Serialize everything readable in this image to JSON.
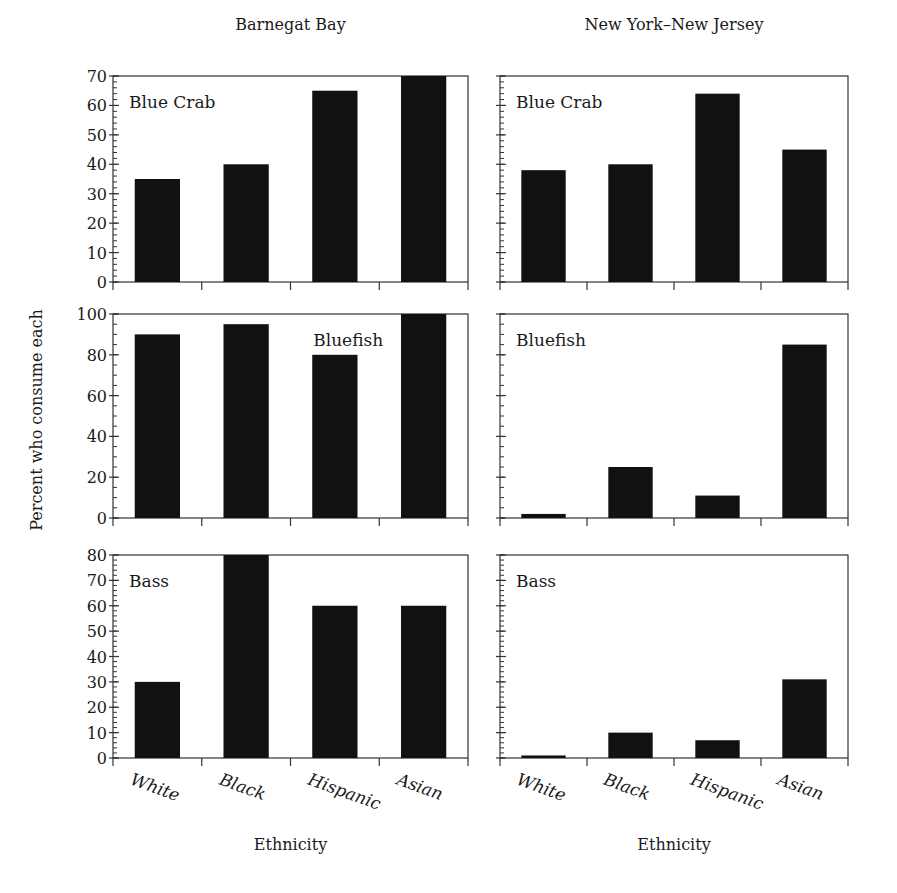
{
  "chart_data": {
    "type": "bar",
    "title": "",
    "ylabel": "Percent who consume each",
    "xlabel": "Ethnicity",
    "categories": [
      "White",
      "Black",
      "Hispanic",
      "Asian"
    ],
    "columns": [
      "Barnegat Bay",
      "New York–New Jersey"
    ],
    "grid": false,
    "bar_color": "#111111",
    "panels": [
      {
        "row": 0,
        "col": 0,
        "location": "Barnegat Bay",
        "species": "Blue Crab",
        "ylim": [
          0,
          70
        ],
        "major_ticks": [
          0,
          10,
          20,
          30,
          40,
          50,
          60,
          70
        ],
        "minor_step": 2,
        "values": [
          35,
          40,
          65,
          70
        ],
        "label_pos": "left"
      },
      {
        "row": 0,
        "col": 1,
        "location": "New York–New Jersey",
        "species": "Blue Crab",
        "ylim": [
          0,
          70
        ],
        "major_ticks": [
          0,
          10,
          20,
          30,
          40,
          50,
          60,
          70
        ],
        "minor_step": 2,
        "values": [
          38,
          40,
          64,
          45
        ],
        "label_pos": "left"
      },
      {
        "row": 1,
        "col": 0,
        "location": "Barnegat Bay",
        "species": "Bluefish",
        "ylim": [
          0,
          100
        ],
        "major_ticks": [
          0,
          20,
          40,
          60,
          80,
          100
        ],
        "minor_step": 5,
        "values": [
          90,
          95,
          80,
          100
        ],
        "label_pos": "center"
      },
      {
        "row": 1,
        "col": 1,
        "location": "New York–New Jersey",
        "species": "Bluefish",
        "ylim": [
          0,
          100
        ],
        "major_ticks": [
          0,
          20,
          40,
          60,
          80,
          100
        ],
        "minor_step": 5,
        "values": [
          2,
          25,
          11,
          85
        ],
        "label_pos": "left"
      },
      {
        "row": 2,
        "col": 0,
        "location": "Barnegat Bay",
        "species": "Bass",
        "ylim": [
          0,
          80
        ],
        "major_ticks": [
          0,
          10,
          20,
          30,
          40,
          50,
          60,
          70,
          80
        ],
        "minor_step": 2,
        "values": [
          30,
          80,
          60,
          60
        ],
        "label_pos": "left"
      },
      {
        "row": 2,
        "col": 1,
        "location": "New York–New Jersey",
        "species": "Bass",
        "ylim": [
          0,
          80
        ],
        "major_ticks": [
          0,
          10,
          20,
          30,
          40,
          50,
          60,
          70,
          80
        ],
        "minor_step": 2,
        "values": [
          1,
          10,
          7,
          31
        ],
        "label_pos": "left"
      }
    ]
  }
}
